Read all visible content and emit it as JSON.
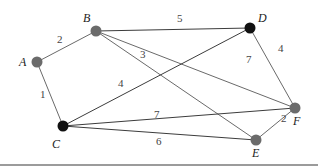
{
  "graph": {
    "type": "weighted-undirected",
    "nodes": [
      {
        "id": "A",
        "label": "A",
        "x": 37,
        "y": 62,
        "color": "#6b6b6b",
        "label_x": 19,
        "label_y": 66
      },
      {
        "id": "B",
        "label": "B",
        "x": 96,
        "y": 31,
        "color": "#6b6b6b",
        "label_x": 83,
        "label_y": 22
      },
      {
        "id": "C",
        "label": "C",
        "x": 63,
        "y": 126,
        "color": "#111111",
        "label_x": 52,
        "label_y": 148
      },
      {
        "id": "D",
        "label": "D",
        "x": 250,
        "y": 28,
        "color": "#111111",
        "label_x": 258,
        "label_y": 22
      },
      {
        "id": "E",
        "label": "E",
        "x": 256,
        "y": 140,
        "color": "#6b6b6b",
        "label_x": 252,
        "label_y": 157
      },
      {
        "id": "F",
        "label": "F",
        "x": 295,
        "y": 108,
        "color": "#6b6b6b",
        "label_x": 293,
        "label_y": 125
      }
    ],
    "edges": [
      {
        "from": "A",
        "to": "B",
        "weight": "2",
        "wx": 57,
        "wy": 43
      },
      {
        "from": "A",
        "to": "C",
        "weight": "1",
        "wx": 40,
        "wy": 98
      },
      {
        "from": "B",
        "to": "D",
        "weight": "5",
        "wx": 177,
        "wy": 22
      },
      {
        "from": "B",
        "to": "F",
        "weight": "7",
        "wx": 246,
        "wy": 63
      },
      {
        "from": "B",
        "to": "E",
        "weight": "3",
        "wx": 140,
        "wy": 58
      },
      {
        "from": "C",
        "to": "D",
        "weight": "4",
        "wx": 118,
        "wy": 87
      },
      {
        "from": "C",
        "to": "F",
        "weight": "7",
        "wx": 154,
        "wy": 118
      },
      {
        "from": "C",
        "to": "E",
        "weight": "6",
        "wx": 156,
        "wy": 145
      },
      {
        "from": "D",
        "to": "F",
        "weight": "4",
        "wx": 278,
        "wy": 52
      },
      {
        "from": "E",
        "to": "F",
        "weight": "2",
        "wx": 281,
        "wy": 122
      }
    ]
  }
}
